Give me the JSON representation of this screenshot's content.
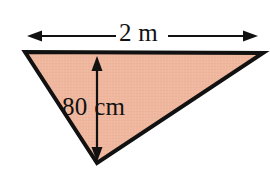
{
  "figure": {
    "name": "triangle-with-dimensions",
    "background_color": "#ffffff",
    "canvas": {
      "width": 270,
      "height": 171
    },
    "shape": {
      "type": "triangle",
      "fill_color": "#efb79e",
      "stroke_color": "#111111",
      "stroke_width": 4,
      "vertices": [
        {
          "name": "top-left",
          "x": 25,
          "y": 52
        },
        {
          "name": "top-right",
          "x": 263,
          "y": 53
        },
        {
          "name": "bottom-apex",
          "x": 97,
          "y": 163
        }
      ]
    },
    "dimensions": [
      {
        "name": "base-width",
        "label": "2 m",
        "value": 2,
        "unit": "m",
        "orientation": "horizontal",
        "arrow_style": "double-headed",
        "line_y": 36,
        "line_x_start": 28,
        "line_x_end": 257,
        "color": "#111111"
      },
      {
        "name": "perpendicular-height",
        "label": "80 cm",
        "value": 80,
        "unit": "cm",
        "orientation": "vertical",
        "arrow_style": "double-headed",
        "line_x": 97,
        "line_y_start": 57,
        "line_y_end": 160,
        "color": "#111111"
      }
    ]
  }
}
